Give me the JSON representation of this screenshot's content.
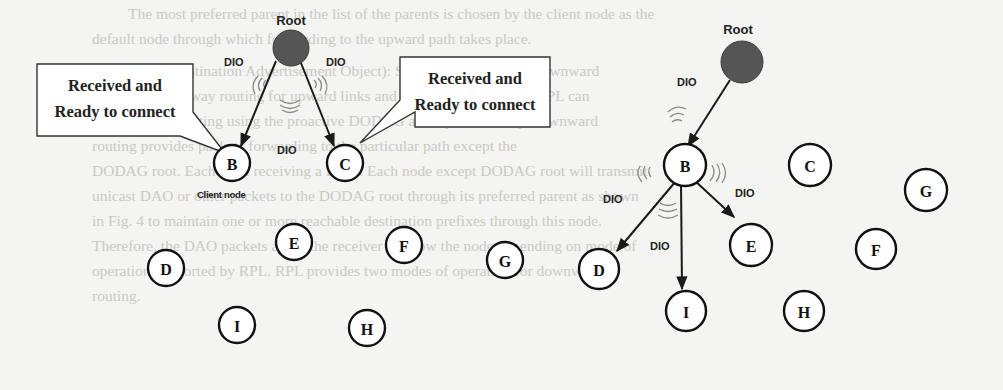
{
  "background_text": [
    "The most preferred parent in the list of the parents is chosen by the client node as the",
    "default node through which forwarding to the upward path takes place.",
    "DAO (Destination Advertisement Object): Simple directions and downward",
    "packets in both way routing for upward links and DIO communication. RPL can",
    "work upward routing using the proactive DODAG as only. Ultimately, downward",
    "routing provides packets forwarding to the particular path except the",
    "DODAG root. Each node receiving a DAO. Each node except DODAG root will transmit",
    "unicast DAO or other packets to the DODAG root through its preferred parent as shown",
    "in Fig. 4 to maintain one or more reachable destination prefixes through this node.",
    "Therefore, the DAO packets allow the receiver to know the node depending on mode of",
    "operation supported by RPL. RPL provides two modes of operation for downward",
    "routing."
  ],
  "diagrams": {
    "left": {
      "root_label": "Root",
      "dio_labels": [
        "DIO",
        "DIO",
        "DIO"
      ],
      "callout_left": {
        "line1": "Received and",
        "line2": "Ready to connect"
      },
      "callout_right": {
        "line1": "Received and",
        "line2": "Ready to connect"
      },
      "client_node_label": "Client node",
      "nodes": [
        "B",
        "C",
        "D",
        "E",
        "F",
        "G",
        "I",
        "H"
      ]
    },
    "right": {
      "root_label": "Root",
      "dio_labels": [
        "DIO",
        "DIO",
        "DIO",
        "DIO"
      ],
      "nodes": [
        "B",
        "C",
        "G",
        "D",
        "E",
        "F",
        "I",
        "H"
      ]
    }
  },
  "colors": {
    "root_fill": "#555555",
    "node_stroke": "#111111",
    "wave": "#8a8a8a",
    "background_text": "#c9c9c6"
  }
}
